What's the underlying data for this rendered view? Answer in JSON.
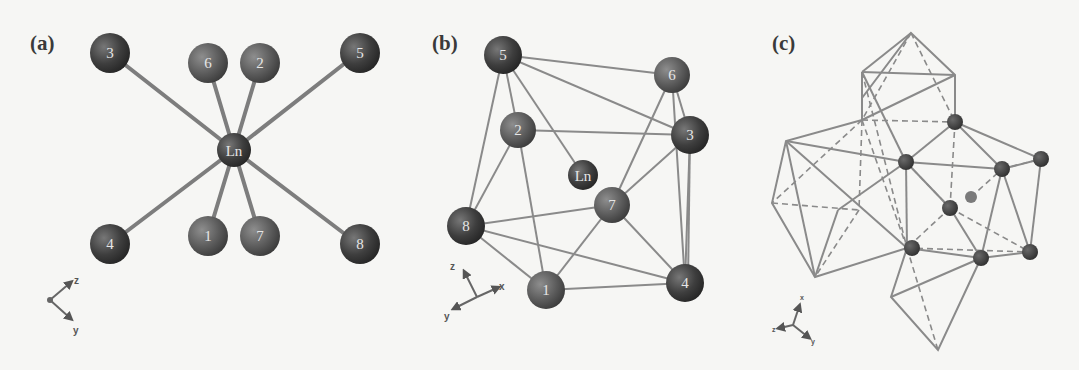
{
  "figure": {
    "panels": [
      {
        "id": "a",
        "label": "(a)",
        "center_atom": "Ln",
        "ligand_atoms": [
          "3",
          "6",
          "2",
          "5",
          "4",
          "1",
          "7",
          "8"
        ],
        "axes": [
          "z",
          "y"
        ]
      },
      {
        "id": "b",
        "label": "(b)",
        "center_atom": "Ln",
        "ligand_atoms": [
          "5",
          "6",
          "2",
          "3",
          "8",
          "7",
          "1",
          "4"
        ],
        "axes": [
          "z",
          "x",
          "y"
        ]
      },
      {
        "id": "c",
        "label": "(c)",
        "axes": [
          "x",
          "z",
          "y"
        ]
      }
    ]
  },
  "colors": {
    "background": "#f6f6f4",
    "atom_dark": "#3c3c3c",
    "atom_mid": "#5e5e5e",
    "bond": "#7d7d7d",
    "edge": "#8a8a8a"
  }
}
